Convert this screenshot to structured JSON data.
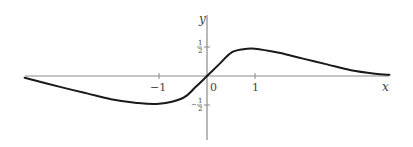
{
  "chart_data": {
    "type": "line",
    "title": "",
    "xlabel": "x",
    "ylabel": "y",
    "x_ticks": [
      {
        "value": -1,
        "label": "−1"
      },
      {
        "value": 0,
        "label": "0"
      },
      {
        "value": 1,
        "label": "1"
      }
    ],
    "y_ticks": [
      {
        "value": 0.5,
        "label": "1/2"
      },
      {
        "value": -0.5,
        "label": "−1/2"
      }
    ],
    "xlim": [
      -3.8,
      3.8
    ],
    "ylim": [
      -1.1,
      1.05
    ],
    "grid": false,
    "legend": null,
    "series": [
      {
        "name": "curve",
        "x": [
          -3.8,
          -3.0,
          -2.5,
          -2.0,
          -1.5,
          -1.0,
          -0.5,
          -0.25,
          0.0,
          0.25,
          0.5,
          0.75,
          1.0,
          1.5,
          2.0,
          2.5,
          3.0,
          3.5,
          3.8
        ],
        "y": [
          -0.03,
          -0.2,
          -0.3,
          -0.4,
          -0.46,
          -0.48,
          -0.38,
          -0.2,
          0.0,
          0.2,
          0.4,
          0.46,
          0.47,
          0.4,
          0.3,
          0.2,
          0.1,
          0.04,
          0.02
        ]
      }
    ]
  },
  "labels": {
    "x_axis": "x",
    "y_axis": "y",
    "origin": "0",
    "x_neg_one": "−1",
    "x_one": "1",
    "y_half_num": "1",
    "y_half_den": "2",
    "y_neg_half_sign": "−",
    "y_neg_half_num": "1",
    "y_neg_half_den": "2"
  }
}
